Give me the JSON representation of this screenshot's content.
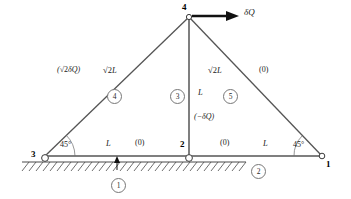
{
  "figure": {
    "type": "truss-virtual-work-diagram",
    "nodes": [
      {
        "id": "1",
        "label": "1",
        "x": 322,
        "y": 156,
        "support": "roller"
      },
      {
        "id": "2",
        "label": "2",
        "x": 189,
        "y": 156,
        "support": "pin"
      },
      {
        "id": "3",
        "label": "3",
        "x": 45,
        "y": 156,
        "support": "pin"
      },
      {
        "id": "4",
        "label": "4",
        "x": 189,
        "y": 17,
        "support": "none"
      }
    ],
    "members": [
      {
        "id": "1",
        "label": "1",
        "from": "3",
        "to": "2",
        "length_label": "L",
        "force_label": "(0)"
      },
      {
        "id": "2",
        "label": "2",
        "from": "2",
        "to": "1",
        "length_label": "L",
        "force_label": "(0)"
      },
      {
        "id": "3",
        "label": "3",
        "from": "2",
        "to": "4",
        "length_label": "L",
        "force_label": "(−δQ)"
      },
      {
        "id": "4",
        "label": "4",
        "from": "3",
        "to": "4",
        "length_label": "√2 L",
        "force_label": "(√2 δQ)"
      },
      {
        "id": "5",
        "label": "5",
        "from": "4",
        "to": "1",
        "length_label": "√2 L",
        "force_label": "(0)"
      }
    ],
    "load": {
      "label": "δQ",
      "at_node": "4",
      "direction": "right"
    },
    "angles": [
      {
        "label": "45°",
        "at_node": "3"
      },
      {
        "label": "45°",
        "at_node": "1"
      }
    ],
    "length_labels": {
      "bottom_left": "L",
      "bottom_right": "L",
      "vertical": "L",
      "left_diagonal_radicand": "2",
      "left_diagonal_suffix": "L",
      "right_diagonal_radicand": "2",
      "right_diagonal_suffix": "L"
    },
    "force_labels": {
      "bottom_left": "(0)",
      "bottom_right": "(0)",
      "vertical": "(−δQ)",
      "left_diagonal_prefix": "(",
      "left_diagonal_radicand": "2",
      "left_diagonal_suffix": "δQ)",
      "right_diagonal": "(0)"
    },
    "member_circle_labels": {
      "m1": "1",
      "m2": "2",
      "m3": "3",
      "m4": "4",
      "m5": "5"
    },
    "colors": {
      "member_stroke": "#555555",
      "ground_stroke": "#4a4a4a",
      "text": "#1a1a1a",
      "node_fill": "#ffffff"
    }
  }
}
